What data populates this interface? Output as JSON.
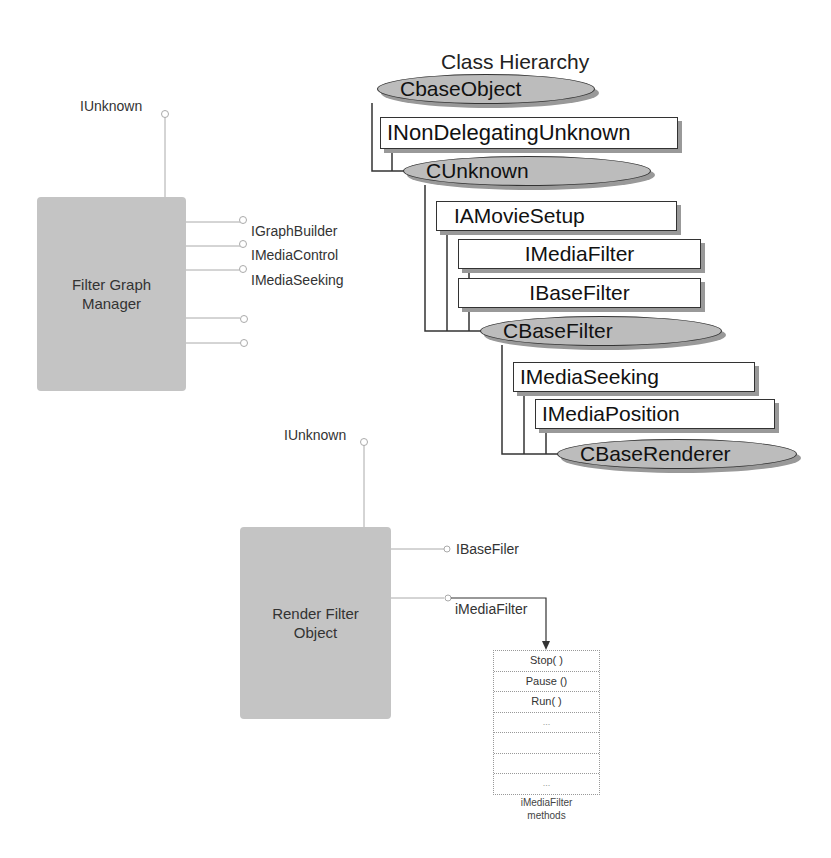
{
  "class_hierarchy": {
    "title": "Class Hierarchy",
    "nodes": [
      {
        "label": "CbaseObject",
        "kind": "class"
      },
      {
        "label": "INonDelegatingUnknown",
        "kind": "interface"
      },
      {
        "label": "CUnknown",
        "kind": "class"
      },
      {
        "label": "IAMovieSetup",
        "kind": "interface"
      },
      {
        "label": "IMediaFilter",
        "kind": "interface"
      },
      {
        "label": "IBaseFilter",
        "kind": "interface"
      },
      {
        "label": "CBaseFilter",
        "kind": "class"
      },
      {
        "label": "IMediaSeeking",
        "kind": "interface"
      },
      {
        "label": "IMediaPosition",
        "kind": "interface"
      },
      {
        "label": "CBaseRenderer",
        "kind": "class"
      }
    ]
  },
  "filter_graph_manager": {
    "label_line1": "Filter Graph",
    "label_line2": "Manager",
    "top_interface": "IUnknown",
    "interfaces": [
      "IGraphBuilder",
      "IMediaControl",
      "IMediaSeeking",
      "",
      ""
    ]
  },
  "render_filter_object": {
    "label_line1": "Render Filter",
    "label_line2": "Object",
    "top_interface": "IUnknown",
    "interfaces": [
      "IBaseFiler",
      "iMediaFilter"
    ]
  },
  "methods_table": {
    "rows": [
      "Stop( )",
      "Pause ()",
      "Run( )",
      "...",
      "",
      "",
      "..."
    ],
    "caption_line1": "iMediaFilter",
    "caption_line2": "methods"
  },
  "colors": {
    "class_fill": "#bcbcbc",
    "component_fill": "#c4c4c4",
    "outline": "#333333",
    "shadow": "#999999"
  }
}
